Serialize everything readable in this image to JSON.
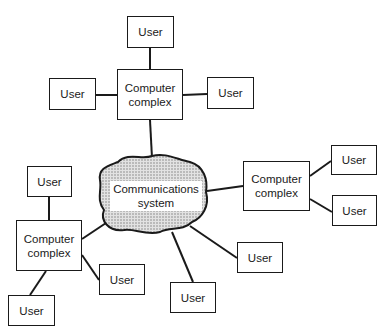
{
  "diagram": {
    "caption_fragment": "",
    "center": {
      "label_line1": "Communications",
      "label_line2": "system"
    },
    "complexes": [
      {
        "id": "top",
        "label_line1": "Computer",
        "label_line2": "complex"
      },
      {
        "id": "right",
        "label_line1": "Computer",
        "label_line2": "complex"
      },
      {
        "id": "left",
        "label_line1": "Computer",
        "label_line2": "complex"
      }
    ],
    "users": [
      {
        "label": "User"
      },
      {
        "label": "User"
      },
      {
        "label": "User"
      },
      {
        "label": "User"
      },
      {
        "label": "User"
      },
      {
        "label": "User"
      },
      {
        "label": "User"
      },
      {
        "label": "User"
      },
      {
        "label": "User"
      },
      {
        "label": "User"
      }
    ]
  }
}
